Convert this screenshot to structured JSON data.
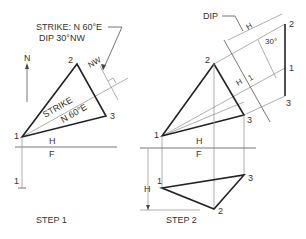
{
  "step1": {
    "callout_strike": "STRIKE: N 60°E",
    "callout_dip": "DIP 30°NW",
    "north_label": "N",
    "nw_label": "NW",
    "strike_label": "STRIKE",
    "strike_bearing": "N 60°E",
    "points": {
      "p1": "1",
      "p2": "2",
      "p3": "3",
      "p1_front": "1"
    },
    "fold_upper": "H",
    "fold_lower": "F",
    "caption": "STEP 1"
  },
  "step2": {
    "dip_label": "DIP",
    "dim_h_aux": "H",
    "angle_label": "30°",
    "fold_aux_h": "H",
    "fold_aux_1": "1",
    "points_top": {
      "p1": "1",
      "p2": "2",
      "p3": "3"
    },
    "points_aux": {
      "p1": "1",
      "p2": "2",
      "p3": "3"
    },
    "points_front": {
      "p1": "1",
      "p2": "2",
      "p3": "3"
    },
    "fold_upper": "H",
    "fold_lower": "F",
    "dim_h_front": "H",
    "caption": "STEP 2"
  }
}
